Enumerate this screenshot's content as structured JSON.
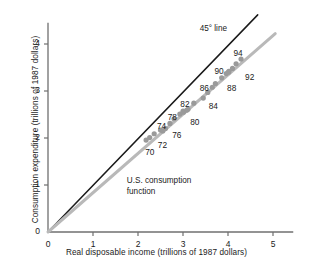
{
  "chart_data": {
    "type": "scatter",
    "title": "",
    "xlabel": "Real disposable income (trillions of 1987 dollars)",
    "ylabel": "Consumption expenditure (trillions of 1987 dollars)",
    "xlim": [
      0,
      5.45
    ],
    "ylim": [
      0,
      4.45
    ],
    "xticks": [
      "0",
      "1",
      "2",
      "3",
      "4",
      "5"
    ],
    "xtick_values": [
      0,
      1,
      2,
      3,
      4,
      5
    ],
    "yticks": [
      "0",
      "1",
      "2",
      "3",
      "4"
    ],
    "ytick_values": [
      0,
      1,
      2,
      3,
      4
    ],
    "grid": false,
    "legend": "none",
    "series": [
      {
        "name": "U.S. consumption function",
        "type": "scatter+line",
        "color": "#9a9a9a",
        "line_color": "#b9b9b9",
        "points": [
          {
            "label": "70",
            "x": 2.18,
            "y": 1.955
          },
          {
            "label": "71",
            "x": 2.26,
            "y": 2.01
          },
          {
            "label": "72",
            "x": 2.36,
            "y": 2.09
          },
          {
            "label": "73",
            "x": 2.5,
            "y": 2.17
          },
          {
            "label": "74",
            "x": 2.55,
            "y": 2.15
          },
          {
            "label": "75",
            "x": 2.61,
            "y": 2.2
          },
          {
            "label": "76",
            "x": 2.71,
            "y": 2.31
          },
          {
            "label": "77",
            "x": 2.8,
            "y": 2.41
          },
          {
            "label": "78",
            "x": 2.93,
            "y": 2.51
          },
          {
            "label": "79",
            "x": 3.0,
            "y": 2.57
          },
          {
            "label": "80",
            "x": 3.01,
            "y": 2.55
          },
          {
            "label": "81",
            "x": 3.08,
            "y": 2.59
          },
          {
            "label": "82",
            "x": 3.11,
            "y": 2.61
          },
          {
            "label": "83",
            "x": 3.24,
            "y": 2.74
          },
          {
            "label": "84",
            "x": 3.45,
            "y": 2.85
          },
          {
            "label": "85",
            "x": 3.55,
            "y": 2.97
          },
          {
            "label": "86",
            "x": 3.65,
            "y": 3.08
          },
          {
            "label": "87",
            "x": 3.72,
            "y": 3.16
          },
          {
            "label": "88",
            "x": 3.86,
            "y": 3.28
          },
          {
            "label": "89",
            "x": 3.96,
            "y": 3.37
          },
          {
            "label": "90",
            "x": 4.02,
            "y": 3.42
          },
          {
            "label": "91",
            "x": 4.01,
            "y": 3.4
          },
          {
            "label": "92",
            "x": 4.1,
            "y": 3.48
          },
          {
            "label": "93",
            "x": 4.18,
            "y": 3.58
          },
          {
            "label": "94",
            "x": 4.29,
            "y": 3.68
          }
        ],
        "line_from": {
          "x": 0.0,
          "y": 0.0
        },
        "line_to": {
          "x": 5.05,
          "y": 4.22
        }
      },
      {
        "name": "45° line",
        "type": "line",
        "color": "#1a1a1a",
        "line_from": {
          "x": 0.0,
          "y": 0.0
        },
        "line_to": {
          "x": 4.66,
          "y": 4.62
        }
      }
    ],
    "point_labels": [
      {
        "text": "70",
        "x": 2.16,
        "y": 1.7
      },
      {
        "text": "72",
        "x": 2.44,
        "y": 1.86
      },
      {
        "text": "74",
        "x": 2.42,
        "y": 2.25
      },
      {
        "text": "76",
        "x": 2.76,
        "y": 2.07
      },
      {
        "text": "78",
        "x": 2.66,
        "y": 2.45
      },
      {
        "text": "80",
        "x": 3.16,
        "y": 2.33
      },
      {
        "text": "82",
        "x": 2.94,
        "y": 2.73
      },
      {
        "text": "84",
        "x": 3.57,
        "y": 2.69
      },
      {
        "text": "86",
        "x": 3.37,
        "y": 3.06
      },
      {
        "text": "88",
        "x": 3.98,
        "y": 3.07
      },
      {
        "text": "90",
        "x": 3.7,
        "y": 3.42
      },
      {
        "text": "92",
        "x": 4.38,
        "y": 3.3
      },
      {
        "text": "94",
        "x": 4.12,
        "y": 3.81
      }
    ],
    "annotations": [
      {
        "name": "forty-five-degree-line-label",
        "text": "45° line",
        "x": 3.37,
        "y": 4.32
      },
      {
        "name": "consumption-function-label",
        "text_line1": "U.S. consumption",
        "text_line2": "function",
        "x": 1.75,
        "y": 1.08
      }
    ]
  },
  "axis": {
    "x_title": "Real disposable income (trillions of 1987 dollars)",
    "y_title": "Consumption expenditure (trillions of 1987 dollars)"
  },
  "colors": {
    "axis": "#6f6f6f",
    "forty_five_line": "#1a1a1a",
    "consumption_line": "#b9b9b9",
    "marker": "#9a9a9a",
    "text": "#1a1a1a",
    "background": "#ffffff"
  }
}
